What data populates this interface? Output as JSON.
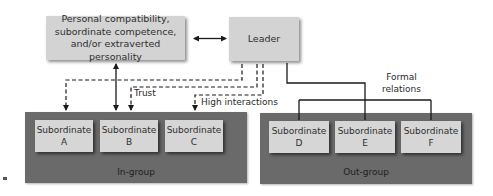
{
  "diagram": {
    "nodes": {
      "factors": {
        "lines": [
          "Personal compatibility,",
          "subordinate competence,",
          "and/or extraverted personality"
        ]
      },
      "leader": {
        "label": "Leader"
      }
    },
    "edge_labels": {
      "trust": "Trust",
      "high_interactions": "High interactions",
      "formal_relations": [
        "Formal",
        "relations"
      ]
    },
    "groups": {
      "in_group": {
        "label": "In-group",
        "members": [
          {
            "line1": "Subordinate",
            "line2": "A"
          },
          {
            "line1": "Subordinate",
            "line2": "B"
          },
          {
            "line1": "Subordinate",
            "line2": "C"
          }
        ]
      },
      "out_group": {
        "label": "Out-group",
        "members": [
          {
            "line1": "Subordinate",
            "line2": "D"
          },
          {
            "line1": "Subordinate",
            "line2": "E"
          },
          {
            "line1": "Subordinate",
            "line2": "F"
          }
        ]
      }
    },
    "colors": {
      "node_fill": "#d3d3d3",
      "group_fill": "#6a6a6a",
      "line": "#1a1a1a"
    }
  }
}
